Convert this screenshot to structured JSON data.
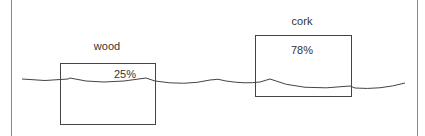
{
  "diagram": {
    "objects": [
      {
        "name": "wood",
        "percent_above_water": "25%"
      },
      {
        "name": "cork",
        "percent_above_water": "78%"
      }
    ],
    "colors": {
      "line": "#555555",
      "background": "#ffffff"
    }
  }
}
